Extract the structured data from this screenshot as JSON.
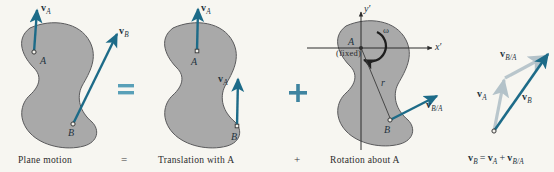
{
  "figure": {
    "title_equation": "v_B = v_A + v_B/A",
    "background_color": "#f7f6f1",
    "body_fill": "#a9a9a9",
    "body_stroke": "#58585a",
    "vector_color": "#1d6b88",
    "vector_light_color": "#b9c6cc",
    "operator_color": "#4e90aa",
    "axis_color": "#2c2c2c"
  },
  "panels": [
    {
      "id": "plane-motion",
      "caption": "Plane motion",
      "points": [
        {
          "label": "A"
        },
        {
          "label": "B"
        }
      ],
      "vectors": [
        {
          "label": "v",
          "sub": "A",
          "from": "A",
          "style": "dark"
        },
        {
          "label": "v",
          "sub": "B",
          "from": "B",
          "style": "dark"
        }
      ]
    },
    {
      "id": "translation-with-a",
      "caption": "Translation with A",
      "points": [
        {
          "label": "A"
        },
        {
          "label": "B"
        }
      ],
      "vectors": [
        {
          "label": "v",
          "sub": "A",
          "from": "A",
          "style": "dark"
        },
        {
          "label": "v",
          "sub": "A",
          "from": "B",
          "style": "dark"
        }
      ]
    },
    {
      "id": "rotation-about-a",
      "caption": "Rotation about A",
      "points": [
        {
          "label": "A",
          "note": "(fixed)"
        },
        {
          "label": "B"
        }
      ],
      "axes": [
        {
          "label": "y",
          "prime": "′"
        },
        {
          "label": "x",
          "prime": "′"
        }
      ],
      "omega_label": "ω",
      "radius_label": "r",
      "vectors": [
        {
          "label": "v",
          "sub": "B/A",
          "from": "B",
          "style": "dark"
        }
      ]
    },
    {
      "id": "vector-triangle",
      "caption": "",
      "vectors": [
        {
          "label": "v",
          "sub": "A",
          "style": "light"
        },
        {
          "label": "v",
          "sub": "B/A",
          "style": "light"
        },
        {
          "label": "v",
          "sub": "B",
          "style": "dark"
        }
      ]
    }
  ],
  "operators": {
    "equals_symbol": "=",
    "plus_symbol": "+",
    "caption_equals": "=",
    "caption_plus": "+"
  },
  "result_equation": {
    "lhs_bold": "v",
    "lhs_sub": "B",
    "eq": "=",
    "t1_bold": "v",
    "t1_sub": "A",
    "plus": "+",
    "t2_bold": "v",
    "t2_sub": "B/A"
  }
}
